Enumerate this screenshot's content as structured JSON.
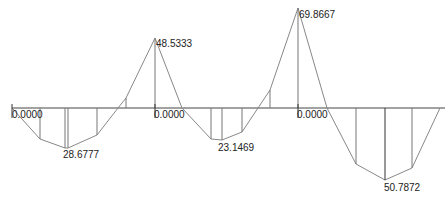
{
  "diagram": {
    "type": "bending-moment-diagram",
    "baseline_color": "#444444",
    "curve_color": "#888888",
    "ordinate_color": "#777777",
    "labels": [
      {
        "id": "support-1",
        "text": "0.0000"
      },
      {
        "id": "span-1-max",
        "text": "28.6777"
      },
      {
        "id": "support-2-peak",
        "text": "48.5333"
      },
      {
        "id": "support-2",
        "text": "0.0000"
      },
      {
        "id": "span-2-max",
        "text": "23.1469"
      },
      {
        "id": "support-3-peak",
        "text": "69.8667"
      },
      {
        "id": "support-3",
        "text": "0.0000"
      },
      {
        "id": "span-3-max",
        "text": "50.7872"
      }
    ]
  }
}
